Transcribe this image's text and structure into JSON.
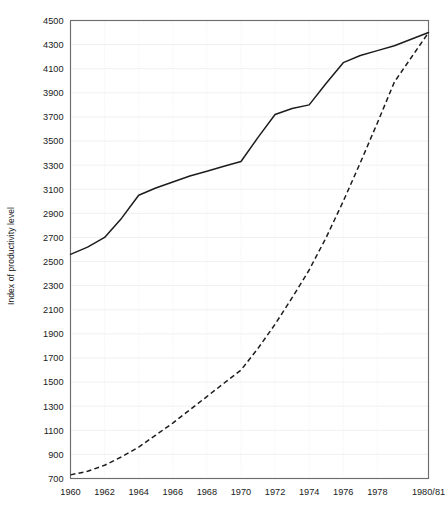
{
  "chart_data": {
    "type": "line",
    "title": "",
    "xlabel": "",
    "ylabel": "Index of productivity level",
    "xlim": [
      1960,
      1981
    ],
    "ylim": [
      700,
      4500
    ],
    "grid": true,
    "legend": "none",
    "y_ticks": [
      700,
      900,
      1100,
      1300,
      1500,
      1700,
      1900,
      2100,
      2300,
      2500,
      2700,
      2900,
      3100,
      3300,
      3500,
      3700,
      3900,
      4100,
      4300,
      4500
    ],
    "x_ticks": [
      1960,
      1962,
      1964,
      1966,
      1968,
      1970,
      1972,
      1974,
      1976,
      1978,
      1981
    ],
    "x_tick_labels": [
      "1960",
      "1962",
      "1964",
      "1966",
      "1968",
      "1970",
      "1972",
      "1974",
      "1976",
      "1978",
      "1980/81"
    ],
    "x": [
      1960,
      1961,
      1962,
      1963,
      1964,
      1965,
      1966,
      1967,
      1968,
      1969,
      1970,
      1971,
      1972,
      1973,
      1974,
      1975,
      1976,
      1977,
      1978,
      1979,
      1981
    ],
    "series": [
      {
        "name": "solid-series",
        "style": "solid",
        "color": "#1c1c1c",
        "values": [
          2560,
          2620,
          2700,
          2860,
          3050,
          3110,
          3160,
          3210,
          3250,
          3290,
          3330,
          3530,
          3720,
          3770,
          3800,
          3980,
          4150,
          4210,
          4250,
          4290,
          4400
        ]
      },
      {
        "name": "dashed-series",
        "style": "dashed",
        "color": "#1c1c1c",
        "values": [
          730,
          760,
          810,
          880,
          960,
          1060,
          1160,
          1270,
          1380,
          1490,
          1600,
          1780,
          1980,
          2200,
          2430,
          2700,
          3000,
          3320,
          3650,
          3990,
          4400
        ]
      }
    ]
  }
}
